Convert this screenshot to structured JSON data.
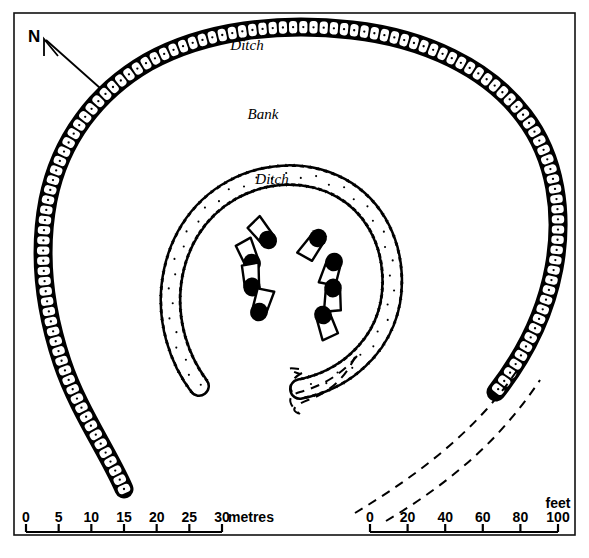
{
  "figure": {
    "type": "archaeological-site-plan"
  },
  "labels": {
    "north": "N",
    "outer_ditch": "Ditch",
    "bank": "Bank",
    "inner_ditch": "Ditch"
  },
  "scales": {
    "metric": {
      "unit": "metres",
      "ticks": [
        "0",
        "5",
        "10",
        "15",
        "20",
        "25",
        "30"
      ],
      "min": 0,
      "max": 30
    },
    "imperial": {
      "unit": "feet",
      "ticks": [
        "0",
        "20",
        "40",
        "60",
        "80",
        "100"
      ],
      "min": 0,
      "max": 100
    }
  },
  "colors": {
    "ink": "#000000",
    "paper": "#ffffff",
    "frame": "#111111"
  },
  "stones": [
    {
      "id": "stone-1",
      "cx": 268,
      "cy": 240,
      "angle": 232
    },
    {
      "id": "stone-2",
      "cx": 252,
      "cy": 263,
      "angle": 248
    },
    {
      "id": "stone-3",
      "cx": 252,
      "cy": 287,
      "angle": 266
    },
    {
      "id": "stone-4",
      "cx": 259,
      "cy": 312,
      "angle": 288
    },
    {
      "id": "stone-5",
      "cx": 318,
      "cy": 238,
      "angle": 126
    },
    {
      "id": "stone-6",
      "cx": 334,
      "cy": 262,
      "angle": 108
    },
    {
      "id": "stone-7",
      "cx": 333,
      "cy": 288,
      "angle": 92
    },
    {
      "id": "stone-8",
      "cx": 323,
      "cy": 315,
      "angle": 72
    }
  ]
}
